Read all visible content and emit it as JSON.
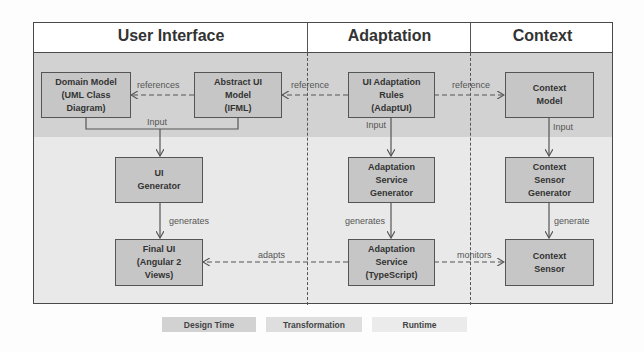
{
  "columns": [
    {
      "title": "User Interface"
    },
    {
      "title": "Adaptation"
    },
    {
      "title": "Context"
    }
  ],
  "boxes": {
    "domain_model": "Domain Model\n(UML Class\nDiagram)",
    "abstract_ui": "Abstract UI\nModel\n(IFML)",
    "ui_adaptation_rules": "UI Adaptation\nRules\n(AdaptUI)",
    "context_model": "Context\nModel",
    "ui_generator": "UI\nGenerator",
    "adaptation_service_generator": "Adaptation\nService\nGenerator",
    "context_sensor_generator": "Context\nSensor\nGenerator",
    "final_ui": "Final UI\n(Angular 2\nViews)",
    "adaptation_service": "Adaptation\nService\n(TypeScript)",
    "context_sensor": "Context\nSensor"
  },
  "edges": {
    "references": "references",
    "reference_left": "reference",
    "reference_right": "reference",
    "input_ui": "Input",
    "input_adapt": "Input",
    "input_context": "Input",
    "generates_ui": "generates",
    "generates_adapt": "generates",
    "generate_context": "generate",
    "adapts": "adapts",
    "monitors": "monitors"
  },
  "legend": [
    {
      "label": "Design Time",
      "color": "#d2d2d2"
    },
    {
      "label": "Transformation",
      "color": "#dedede"
    },
    {
      "label": "Runtime",
      "color": "#ebebeb"
    }
  ]
}
